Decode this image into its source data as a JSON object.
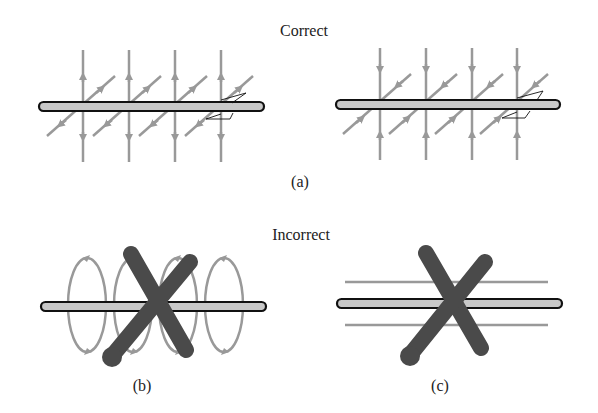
{
  "headings": {
    "correct": "Correct",
    "incorrect": "Incorrect"
  },
  "captions": {
    "a": "(a)",
    "b": "(b)",
    "c": "(c)"
  },
  "colors": {
    "field_line": "#999999",
    "wire_fill": "#c8c8c8",
    "wire_outline": "#111111",
    "cross_mark": "#4a4a4a",
    "text": "#222222"
  },
  "panels": [
    {
      "id": "a-left",
      "group": "correct",
      "description": "Wire with radial field lines pointing outward (vertical arrows away from wire, diagonal arrows away)"
    },
    {
      "id": "a-right",
      "group": "correct",
      "description": "Wire with radial field lines pointing inward (arrows toward wire)"
    },
    {
      "id": "b",
      "group": "incorrect",
      "description": "Circular loops around wire, crossed out"
    },
    {
      "id": "c",
      "group": "incorrect",
      "description": "Field lines parallel to wire, crossed out"
    }
  ]
}
